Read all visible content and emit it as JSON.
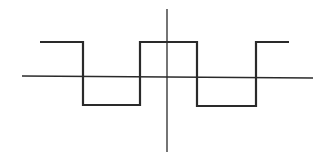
{
  "diagram": {
    "type": "square-wave",
    "colors": {
      "background": "#ffffff",
      "stroke": "#2a2a2a"
    },
    "axes": {
      "horizontal": {
        "x1": 22,
        "y1": 76,
        "x2": 313,
        "y2": 78,
        "width": 1.3
      },
      "vertical": {
        "x1": 167,
        "y1": 9,
        "x2": 167,
        "y2": 152,
        "width": 1.3
      }
    },
    "wave": {
      "high_y": 42,
      "low_y": 105.5,
      "width": 2.2,
      "points": [
        [
          40,
          42
        ],
        [
          83,
          42
        ],
        [
          83,
          105
        ],
        [
          140,
          105
        ],
        [
          140,
          42
        ],
        [
          197,
          42
        ],
        [
          197,
          106
        ],
        [
          256,
          106
        ],
        [
          256,
          42
        ],
        [
          289,
          42
        ]
      ]
    }
  }
}
